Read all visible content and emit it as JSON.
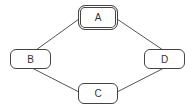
{
  "diagram": {
    "type": "graph",
    "nodes": [
      {
        "id": "A",
        "label": "A",
        "style": "double-border"
      },
      {
        "id": "B",
        "label": "B",
        "style": "single-border"
      },
      {
        "id": "C",
        "label": "C",
        "style": "single-border"
      },
      {
        "id": "D",
        "label": "D",
        "style": "single-border"
      }
    ],
    "edges": [
      {
        "from": "A",
        "to": "B"
      },
      {
        "from": "A",
        "to": "D"
      },
      {
        "from": "B",
        "to": "C"
      },
      {
        "from": "C",
        "to": "D"
      }
    ],
    "colors": {
      "stroke": "#444444",
      "background": "#ffffff",
      "text": "#333333"
    }
  }
}
